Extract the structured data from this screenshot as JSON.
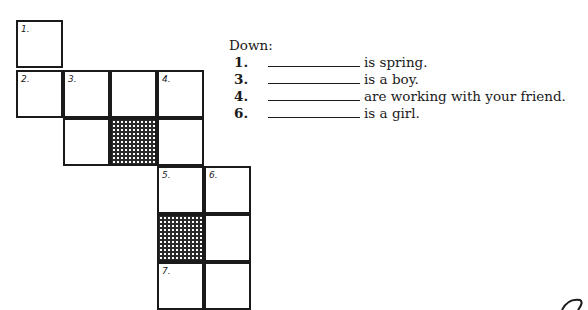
{
  "crossword": {
    "cells": [
      {
        "row": 0,
        "col": 0,
        "num": "1.",
        "shaded": false
      },
      {
        "row": 1,
        "col": 0,
        "num": "2.",
        "shaded": false
      },
      {
        "row": 1,
        "col": 1,
        "num": "3.",
        "shaded": false
      },
      {
        "row": 1,
        "col": 2,
        "num": "",
        "shaded": false
      },
      {
        "row": 1,
        "col": 3,
        "num": "4.",
        "shaded": false
      },
      {
        "row": 2,
        "col": 1,
        "num": "",
        "shaded": false
      },
      {
        "row": 2,
        "col": 2,
        "num": "",
        "shaded": true
      },
      {
        "row": 2,
        "col": 3,
        "num": "",
        "shaded": false
      },
      {
        "row": 3,
        "col": 3,
        "num": "5.",
        "shaded": false
      },
      {
        "row": 3,
        "col": 4,
        "num": "6.",
        "shaded": false
      },
      {
        "row": 4,
        "col": 3,
        "num": "",
        "shaded": true
      },
      {
        "row": 4,
        "col": 4,
        "num": "",
        "shaded": false
      },
      {
        "row": 5,
        "col": 3,
        "num": "7.",
        "shaded": false
      },
      {
        "row": 5,
        "col": 4,
        "num": "",
        "shaded": false
      }
    ]
  },
  "clues": {
    "heading": "Down:",
    "items": [
      {
        "num": "1.",
        "text": "is spring."
      },
      {
        "num": "3.",
        "text": "is a boy."
      },
      {
        "num": "4.",
        "text": "are working with your friend."
      },
      {
        "num": "6.",
        "text": "is a girl."
      }
    ]
  }
}
